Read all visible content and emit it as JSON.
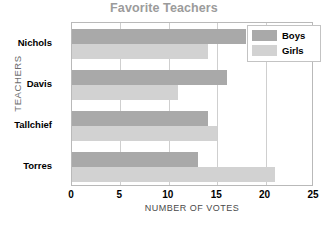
{
  "chart_data": {
    "type": "bar",
    "orientation": "horizontal",
    "title": "Favorite Teachers",
    "xlabel": "NUMBER OF VOTES",
    "ylabel": "TEACHERS",
    "categories": [
      "Nichols",
      "Davis",
      "Tallchief",
      "Torres"
    ],
    "series": [
      {
        "name": "Boys",
        "color": "#a9a9a9",
        "values": [
          18,
          16,
          14,
          13
        ]
      },
      {
        "name": "Girls",
        "color": "#d2d2d2",
        "values": [
          14,
          11,
          15,
          21
        ]
      }
    ],
    "xlim": [
      0,
      25
    ],
    "xticks": [
      0,
      5,
      10,
      15,
      20,
      25
    ],
    "xtick_labels": [
      "0",
      "5",
      "10",
      "15",
      "20",
      "25"
    ],
    "grid": "vertical",
    "legend_position": "top-right",
    "title_color": "#9b9b9b",
    "plot_border_color": "#b9b9b9",
    "gridline_color": "#cfcfcf"
  },
  "legend": {
    "items": [
      {
        "label": "Boys"
      },
      {
        "label": "Girls"
      }
    ]
  }
}
